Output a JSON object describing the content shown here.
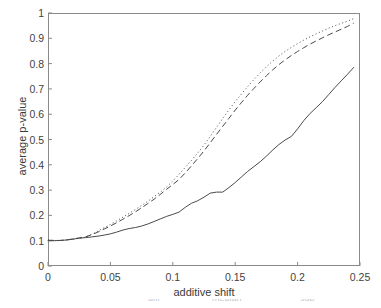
{
  "chart_data": {
    "type": "line",
    "title": "",
    "xlabel": "additive shift",
    "ylabel": "average p-value",
    "xlim": [
      0,
      0.25
    ],
    "ylim": [
      0,
      1
    ],
    "grid": false,
    "legend_position": "none",
    "xticks": [
      "0",
      "0.05",
      "0.1",
      "0.15",
      "0.2",
      "0.25"
    ],
    "xtick_values": [
      0,
      0.05,
      0.1,
      0.15,
      0.2,
      0.25
    ],
    "yticks": [
      "0",
      "0.1",
      "0.2",
      "0.3",
      "0.4",
      "0.5",
      "0.6",
      "0.7",
      "0.8",
      "0.9",
      "1"
    ],
    "ytick_values": [
      0,
      0.1,
      0.2,
      0.3,
      0.4,
      0.5,
      0.6,
      0.7,
      0.8,
      0.9,
      1
    ],
    "x": [
      0,
      0.005,
      0.01,
      0.015,
      0.02,
      0.025,
      0.03,
      0.035,
      0.04,
      0.045,
      0.05,
      0.055,
      0.06,
      0.065,
      0.07,
      0.075,
      0.08,
      0.085,
      0.09,
      0.095,
      0.1,
      0.105,
      0.11,
      0.115,
      0.12,
      0.125,
      0.13,
      0.135,
      0.14,
      0.145,
      0.15,
      0.155,
      0.16,
      0.165,
      0.17,
      0.175,
      0.18,
      0.185,
      0.19,
      0.195,
      0.2,
      0.205,
      0.21,
      0.215,
      0.22,
      0.225,
      0.23,
      0.235,
      0.24,
      0.245
    ],
    "series": [
      {
        "name": "dotted-curve",
        "style": "dotted",
        "color": "#4a4a4a",
        "values": [
          0.103,
          0.101,
          0.101,
          0.103,
          0.106,
          0.11,
          0.114,
          0.125,
          0.138,
          0.151,
          0.164,
          0.178,
          0.193,
          0.208,
          0.223,
          0.239,
          0.256,
          0.274,
          0.292,
          0.312,
          0.336,
          0.362,
          0.39,
          0.418,
          0.447,
          0.478,
          0.512,
          0.548,
          0.583,
          0.617,
          0.65,
          0.68,
          0.709,
          0.737,
          0.763,
          0.787,
          0.81,
          0.83,
          0.848,
          0.864,
          0.879,
          0.893,
          0.906,
          0.918,
          0.929,
          0.94,
          0.95,
          0.959,
          0.968,
          0.978
        ]
      },
      {
        "name": "dashed-curve",
        "style": "dashed",
        "color": "#4a4a4a",
        "values": [
          0.102,
          0.101,
          0.101,
          0.103,
          0.107,
          0.111,
          0.115,
          0.124,
          0.134,
          0.146,
          0.158,
          0.171,
          0.185,
          0.199,
          0.214,
          0.23,
          0.247,
          0.264,
          0.283,
          0.303,
          0.322,
          0.342,
          0.368,
          0.396,
          0.425,
          0.455,
          0.487,
          0.52,
          0.552,
          0.584,
          0.616,
          0.646,
          0.675,
          0.702,
          0.728,
          0.752,
          0.775,
          0.796,
          0.815,
          0.832,
          0.848,
          0.863,
          0.877,
          0.89,
          0.902,
          0.914,
          0.925,
          0.936,
          0.947,
          0.96
        ]
      },
      {
        "name": "solid-curve",
        "style": "solid",
        "color": "#4a4a4a",
        "values": [
          0.1,
          0.1,
          0.101,
          0.103,
          0.106,
          0.11,
          0.112,
          0.115,
          0.118,
          0.122,
          0.127,
          0.134,
          0.142,
          0.148,
          0.152,
          0.158,
          0.166,
          0.176,
          0.186,
          0.196,
          0.204,
          0.213,
          0.232,
          0.248,
          0.258,
          0.272,
          0.288,
          0.292,
          0.292,
          0.31,
          0.33,
          0.352,
          0.374,
          0.393,
          0.412,
          0.434,
          0.458,
          0.48,
          0.498,
          0.512,
          0.542,
          0.575,
          0.603,
          0.626,
          0.65,
          0.678,
          0.706,
          0.732,
          0.758,
          0.785
        ]
      }
    ]
  },
  "caption_fragments": [
    {
      "text": "diff",
      "left": 148
    },
    {
      "text": "median",
      "left": 212
    },
    {
      "text": "sub",
      "left": 300
    }
  ]
}
